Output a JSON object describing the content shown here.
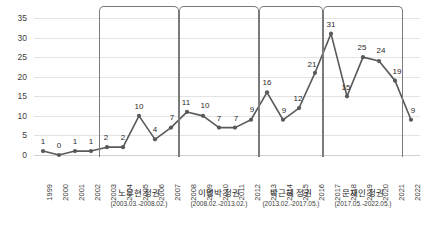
{
  "chart_data": {
    "type": "line",
    "title": "",
    "xlabel": "",
    "ylabel": "",
    "ylim": [
      0,
      35
    ],
    "ytick_step": 5,
    "grid": true,
    "legend": "none",
    "marker": "circle",
    "line_color": "#595959",
    "categories": [
      "1999",
      "2000",
      "2001",
      "2002",
      "2003",
      "2004",
      "2005",
      "2006",
      "2007",
      "2008",
      "2009",
      "2010",
      "2011",
      "2012",
      "2013",
      "2014",
      "2015",
      "2016",
      "2017",
      "2018",
      "2019",
      "2020",
      "2021",
      "2022"
    ],
    "values": [
      1,
      0,
      1,
      1,
      2,
      2,
      10,
      4,
      7,
      11,
      10,
      7,
      7,
      9,
      16,
      9,
      12,
      21,
      31,
      15,
      25,
      24,
      19,
      9
    ],
    "yticks": [
      "0",
      "5",
      "10",
      "15",
      "20",
      "25",
      "30",
      "35"
    ],
    "data_labels": [
      "1",
      "0",
      "1",
      "1",
      "2",
      "2",
      "10",
      "4",
      "7",
      "11",
      "10",
      "7",
      "7",
      "9",
      "16",
      "9",
      "12",
      "21",
      "31",
      "15",
      "25",
      "24",
      "19",
      "9"
    ],
    "annotations": [
      {
        "name": "노무현 정권",
        "period": "(2003.03.-2008.02.)",
        "start_category": "2003",
        "end_category": "2007"
      },
      {
        "name": "이명박 정권",
        "period": "(2008.02.-2013.02.)",
        "start_category": "2008",
        "end_category": "2012"
      },
      {
        "name": "박근혜 정권",
        "period": "(2013.02.-2017.05.)",
        "start_category": "2013",
        "end_category": "2016"
      },
      {
        "name": "문재인 정권",
        "period": "(2017.05.-2022.05.)",
        "start_category": "2017",
        "end_category": "2021"
      }
    ]
  }
}
